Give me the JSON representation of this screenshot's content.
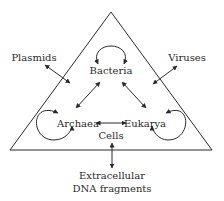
{
  "diagram": {
    "nodes": {
      "bacteria": "Bacteria",
      "archaea": "Archaea",
      "eukarya": "Eukarya",
      "cells": "Cells",
      "plasmids": "Plasmids",
      "viruses": "Viruses",
      "extracellular_line1": "Extracellular",
      "extracellular_line2": "DNA fragments"
    },
    "colors": {
      "stroke": "#2a2a2a",
      "background": "#ffffff"
    }
  }
}
